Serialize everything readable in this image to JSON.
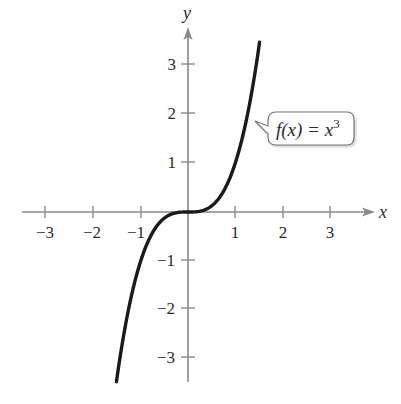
{
  "chart_data": {
    "type": "line",
    "title": "",
    "xlabel": "x",
    "ylabel": "y",
    "xlim": [
      -3.5,
      3.9
    ],
    "ylim": [
      -3.6,
      3.8
    ],
    "x_ticks": [
      -3,
      -2,
      -1,
      1,
      2,
      3
    ],
    "y_ticks": [
      -3,
      -2,
      -1,
      1,
      2,
      3
    ],
    "x_tick_labels": [
      "−3",
      "−2",
      "−1",
      "1",
      "2",
      "3"
    ],
    "y_tick_labels": [
      "−3",
      "−2",
      "−1",
      "1",
      "2",
      "3"
    ],
    "grid": false,
    "series": [
      {
        "name": "f(x) = x^3",
        "function": "x^3",
        "x": [
          -1.51,
          -1.25,
          -1.0,
          -0.75,
          -0.5,
          -0.25,
          0,
          0.25,
          0.5,
          0.75,
          1.0,
          1.25,
          1.51
        ],
        "y": [
          -3.44,
          -1.95,
          -1.0,
          -0.42,
          -0.125,
          -0.016,
          0,
          0.016,
          0.125,
          0.42,
          1.0,
          1.95,
          3.44
        ]
      }
    ],
    "annotations": [
      {
        "text": "f(x) = x³",
        "label_parts": {
          "fx": "f(x) = x",
          "exp": "3"
        },
        "points_to": [
          1.3,
          2.2
        ]
      }
    ],
    "colors": {
      "curve": "#1a1a1a",
      "axes": "#8a8a8a",
      "text": "#2b2b2b"
    }
  }
}
